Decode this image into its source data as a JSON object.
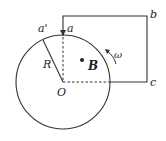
{
  "diagram": {
    "labels": {
      "a_prime": "a'",
      "a": "a",
      "b": "b",
      "c": "c",
      "O": "O",
      "R": "R",
      "B": "B",
      "omega": "ω"
    },
    "colors": {
      "line": "#333333",
      "background": "#ffffff"
    }
  }
}
